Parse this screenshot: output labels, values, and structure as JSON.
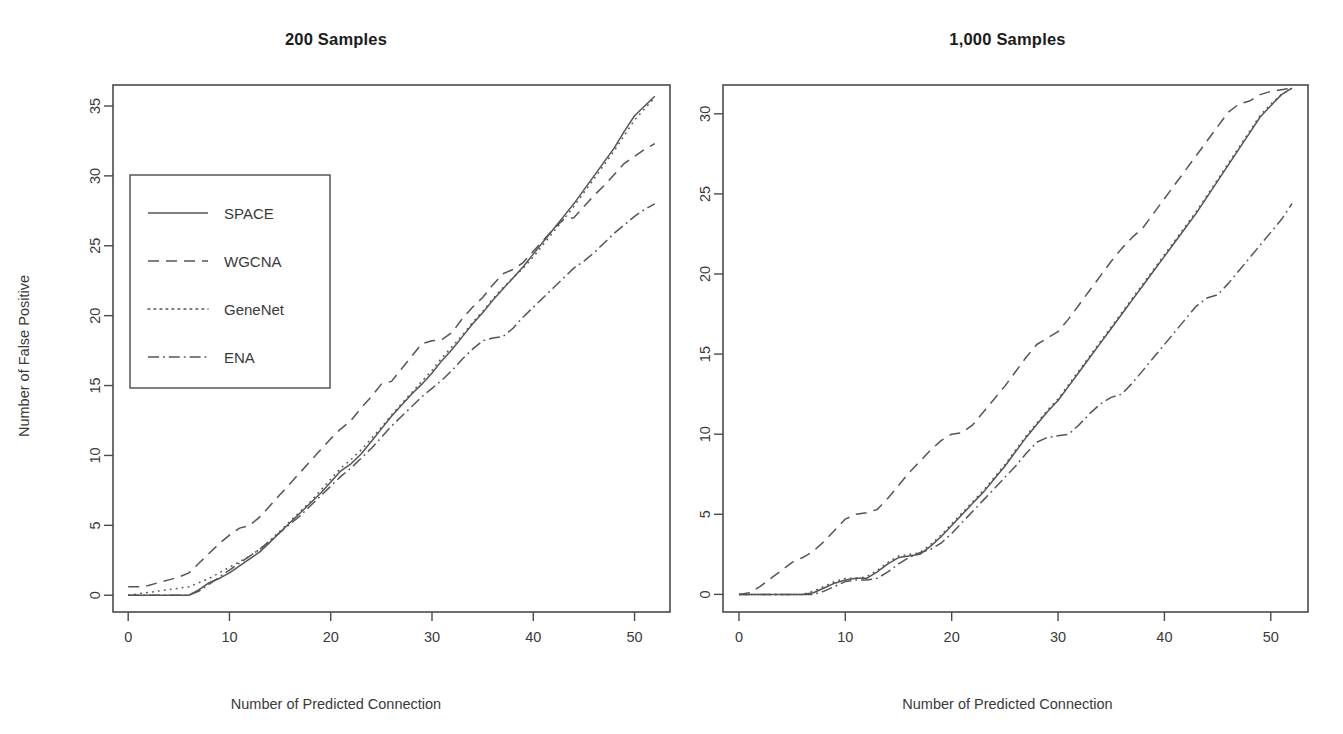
{
  "figure": {
    "background": "#ffffff",
    "ink_color": "#555555",
    "axis_color": "#4a4a4a"
  },
  "chart_data": [
    {
      "type": "line",
      "title": "200 Samples",
      "xlabel": "Number of Predicted Connection",
      "ylabel": "Number of False Positive",
      "xlim": [
        -1.5,
        53.5
      ],
      "ylim": [
        -1.2,
        36.5
      ],
      "xticks": [
        0,
        10,
        20,
        30,
        40,
        50
      ],
      "yticks": [
        0,
        5,
        10,
        15,
        20,
        25,
        30,
        35
      ],
      "xticklabels": [
        "0",
        "10",
        "20",
        "30",
        "40",
        "50"
      ],
      "yticklabels": [
        "0",
        "5",
        "10",
        "15",
        "20",
        "25",
        "30",
        "35"
      ],
      "grid": false,
      "legend": {
        "position": "upper-left-inset",
        "entries": [
          {
            "name": "SPACE",
            "dash": "solid"
          },
          {
            "name": "WGCNA",
            "dash": "dashed"
          },
          {
            "name": "GeneNet",
            "dash": "dotted"
          },
          {
            "name": "ENA",
            "dash": "dashdot"
          }
        ]
      },
      "x": [
        0,
        1,
        2,
        3,
        4,
        5,
        6,
        7,
        8,
        9,
        10,
        11,
        12,
        13,
        14,
        15,
        16,
        17,
        18,
        19,
        20,
        21,
        22,
        23,
        24,
        25,
        26,
        27,
        28,
        29,
        30,
        31,
        32,
        33,
        34,
        35,
        36,
        37,
        38,
        39,
        40,
        41,
        42,
        43,
        44,
        45,
        46,
        47,
        48,
        49,
        50,
        51,
        52
      ],
      "series": [
        {
          "name": "SPACE",
          "dash": "solid",
          "values": [
            0,
            0,
            0,
            0,
            0,
            0,
            0,
            0.4,
            0.9,
            1.2,
            1.6,
            2.1,
            2.6,
            3.1,
            3.8,
            4.5,
            5.2,
            5.9,
            6.6,
            7.3,
            8.1,
            8.9,
            9.4,
            10.1,
            11.0,
            11.9,
            12.8,
            13.6,
            14.4,
            15.1,
            15.9,
            16.8,
            17.6,
            18.5,
            19.4,
            20.2,
            21.1,
            21.9,
            22.7,
            23.5,
            24.4,
            25.3,
            26.2,
            27.1,
            28.0,
            29.0,
            30.0,
            31.0,
            32.0,
            33.2,
            34.3,
            35.0,
            35.7
          ]
        },
        {
          "name": "WGCNA",
          "dash": "dashed",
          "values": [
            0.6,
            0.6,
            0.7,
            0.9,
            1.1,
            1.3,
            1.6,
            2.3,
            3.0,
            3.7,
            4.3,
            4.8,
            5.0,
            5.6,
            6.4,
            7.2,
            8.0,
            8.8,
            9.6,
            10.4,
            11.2,
            11.9,
            12.5,
            13.4,
            14.2,
            15.1,
            15.3,
            16.2,
            17.1,
            18.0,
            18.2,
            18.3,
            18.8,
            19.8,
            20.6,
            21.3,
            22.2,
            23.0,
            23.3,
            23.8,
            24.6,
            25.4,
            26.2,
            26.9,
            27.0,
            27.8,
            28.6,
            29.3,
            30.1,
            30.9,
            31.4,
            31.9,
            32.3
          ]
        },
        {
          "name": "GeneNet",
          "dash": "dotted",
          "values": [
            0,
            0.1,
            0.2,
            0.3,
            0.4,
            0.5,
            0.6,
            0.9,
            1.2,
            1.6,
            2.0,
            2.4,
            2.8,
            3.3,
            3.9,
            4.6,
            5.3,
            6.0,
            6.7,
            7.5,
            8.3,
            9.1,
            9.7,
            10.4,
            11.2,
            12.0,
            12.9,
            13.7,
            14.5,
            15.3,
            16.1,
            17.0,
            17.8,
            18.6,
            19.5,
            20.3,
            21.2,
            22.0,
            22.7,
            23.4,
            24.2,
            25.1,
            26.0,
            26.9,
            27.8,
            28.8,
            29.8,
            30.8,
            31.8,
            32.9,
            34.0,
            34.8,
            35.6
          ]
        },
        {
          "name": "ENA",
          "dash": "dashdot",
          "values": [
            0,
            0,
            0,
            0,
            0,
            0,
            0,
            0.3,
            0.8,
            1.3,
            1.8,
            2.3,
            2.8,
            3.3,
            3.9,
            4.5,
            5.1,
            5.7,
            6.4,
            7.1,
            7.8,
            8.5,
            9.1,
            9.8,
            10.5,
            11.3,
            12.1,
            12.8,
            13.5,
            14.2,
            14.8,
            15.4,
            16.1,
            16.9,
            17.6,
            18.2,
            18.4,
            18.5,
            19.1,
            19.9,
            20.6,
            21.3,
            22.0,
            22.7,
            23.4,
            23.9,
            24.5,
            25.2,
            25.9,
            26.5,
            27.1,
            27.6,
            28.0
          ]
        }
      ]
    },
    {
      "type": "line",
      "title": "1,000 Samples",
      "xlabel": "Number of Predicted Connection",
      "ylabel": "",
      "xlim": [
        -1.5,
        53.5
      ],
      "ylim": [
        -1.1,
        31.8
      ],
      "xticks": [
        0,
        10,
        20,
        30,
        40,
        50
      ],
      "yticks": [
        0,
        5,
        10,
        15,
        20,
        25,
        30
      ],
      "xticklabels": [
        "0",
        "10",
        "20",
        "30",
        "40",
        "50"
      ],
      "yticklabels": [
        "0",
        "5",
        "10",
        "15",
        "20",
        "25",
        "30"
      ],
      "grid": false,
      "legend": {
        "position": "none",
        "entries": []
      },
      "x": [
        0,
        1,
        2,
        3,
        4,
        5,
        6,
        7,
        8,
        9,
        10,
        11,
        12,
        13,
        14,
        15,
        16,
        17,
        18,
        19,
        20,
        21,
        22,
        23,
        24,
        25,
        26,
        27,
        28,
        29,
        30,
        31,
        32,
        33,
        34,
        35,
        36,
        37,
        38,
        39,
        40,
        41,
        42,
        43,
        44,
        45,
        46,
        47,
        48,
        49,
        50,
        51,
        52
      ],
      "series": [
        {
          "name": "SPACE",
          "dash": "solid",
          "values": [
            0,
            0,
            0,
            0,
            0,
            0,
            0,
            0.1,
            0.4,
            0.7,
            0.9,
            1.0,
            1.0,
            1.4,
            1.9,
            2.3,
            2.4,
            2.5,
            3.0,
            3.6,
            4.3,
            5.0,
            5.7,
            6.4,
            7.2,
            8.0,
            8.9,
            9.8,
            10.6,
            11.4,
            12.1,
            13.0,
            13.9,
            14.8,
            15.7,
            16.6,
            17.5,
            18.4,
            19.3,
            20.2,
            21.1,
            22.0,
            22.9,
            23.8,
            24.8,
            25.8,
            26.8,
            27.8,
            28.8,
            29.8,
            30.5,
            31.2,
            31.6
          ]
        },
        {
          "name": "WGCNA",
          "dash": "dashed",
          "values": [
            0,
            0.1,
            0.5,
            1.0,
            1.5,
            2.0,
            2.3,
            2.7,
            3.3,
            4.0,
            4.7,
            5.0,
            5.1,
            5.3,
            6.0,
            6.8,
            7.6,
            8.3,
            9.0,
            9.6,
            10.0,
            10.1,
            10.6,
            11.4,
            12.2,
            13.0,
            13.9,
            14.8,
            15.6,
            16.0,
            16.4,
            17.2,
            18.1,
            19.0,
            19.9,
            20.8,
            21.6,
            22.3,
            22.9,
            23.8,
            24.7,
            25.6,
            26.5,
            27.4,
            28.3,
            29.2,
            30.1,
            30.6,
            30.8,
            31.2,
            31.4,
            31.5,
            31.6
          ]
        },
        {
          "name": "GeneNet",
          "dash": "dotted",
          "values": [
            0,
            0,
            0,
            0,
            0,
            0,
            0,
            0.2,
            0.5,
            0.8,
            1.0,
            1.0,
            1.1,
            1.5,
            2.0,
            2.4,
            2.5,
            2.6,
            3.1,
            3.7,
            4.4,
            5.1,
            5.8,
            6.5,
            7.3,
            8.1,
            9.0,
            9.9,
            10.7,
            11.5,
            12.2,
            13.1,
            14.0,
            14.9,
            15.8,
            16.7,
            17.6,
            18.5,
            19.4,
            20.3,
            21.2,
            22.1,
            23.0,
            23.9,
            24.9,
            25.9,
            26.9,
            27.9,
            28.9,
            29.9,
            30.6,
            31.2,
            31.6
          ]
        },
        {
          "name": "ENA",
          "dash": "dashdot",
          "values": [
            0,
            0,
            0,
            0,
            0,
            0,
            0,
            0,
            0.2,
            0.5,
            0.8,
            0.9,
            0.9,
            1.0,
            1.4,
            1.9,
            2.3,
            2.6,
            2.8,
            3.2,
            3.8,
            4.5,
            5.2,
            5.9,
            6.6,
            7.3,
            8.0,
            8.8,
            9.5,
            9.8,
            9.9,
            10.0,
            10.6,
            11.3,
            11.9,
            12.3,
            12.5,
            13.2,
            14.0,
            14.8,
            15.6,
            16.4,
            17.2,
            18.0,
            18.5,
            18.7,
            19.4,
            20.2,
            21.0,
            21.8,
            22.6,
            23.4,
            24.4
          ]
        }
      ]
    }
  ]
}
